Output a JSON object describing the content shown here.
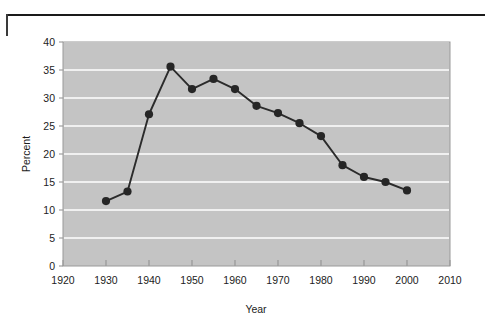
{
  "chart_data": {
    "type": "line",
    "title": "",
    "subtitle": "",
    "xlabel": "Year",
    "ylabel": "Percent",
    "x": [
      1930,
      1935,
      1940,
      1945,
      1950,
      1955,
      1960,
      1965,
      1970,
      1975,
      1980,
      1985,
      1990,
      1995,
      2000
    ],
    "values": [
      11.6,
      13.3,
      27.1,
      35.6,
      31.6,
      33.4,
      31.6,
      28.6,
      27.3,
      25.5,
      23.2,
      18.0,
      15.9,
      15.0,
      13.5
    ],
    "series": [
      {
        "name": "Percent",
        "values": [
          11.6,
          13.3,
          27.1,
          35.6,
          31.6,
          33.4,
          31.6,
          28.6,
          27.3,
          25.5,
          23.2,
          18.0,
          15.9,
          15.0,
          13.5
        ]
      }
    ],
    "xlim": [
      1920,
      2010
    ],
    "ylim": [
      0,
      40
    ],
    "xticks": [
      1920,
      1930,
      1940,
      1950,
      1960,
      1970,
      1980,
      1990,
      2000,
      2010
    ],
    "yticks": [
      0,
      5,
      10,
      15,
      20,
      25,
      30,
      35,
      40
    ],
    "xtick_labels": [
      "1920",
      "1930",
      "1940",
      "1950",
      "1960",
      "1970",
      "1980",
      "1990",
      "2000",
      "2010"
    ],
    "ytick_labels": [
      "0",
      "5",
      "10",
      "15",
      "20",
      "25",
      "30",
      "35",
      "40"
    ],
    "grid": "horizontal",
    "legend": "none",
    "marker": "filled-circle",
    "colors": {
      "plot_background": "#c4c4c4",
      "gridline": "#ffffff",
      "line": "#2b2b2b",
      "marker": "#262626",
      "axis": "#5a5a5a",
      "text": "#1c1c1c",
      "page_background": "#ffffff",
      "rule": "#1a1a1a"
    }
  },
  "axes": {
    "y_title": "Percent",
    "x_title": "Year"
  }
}
